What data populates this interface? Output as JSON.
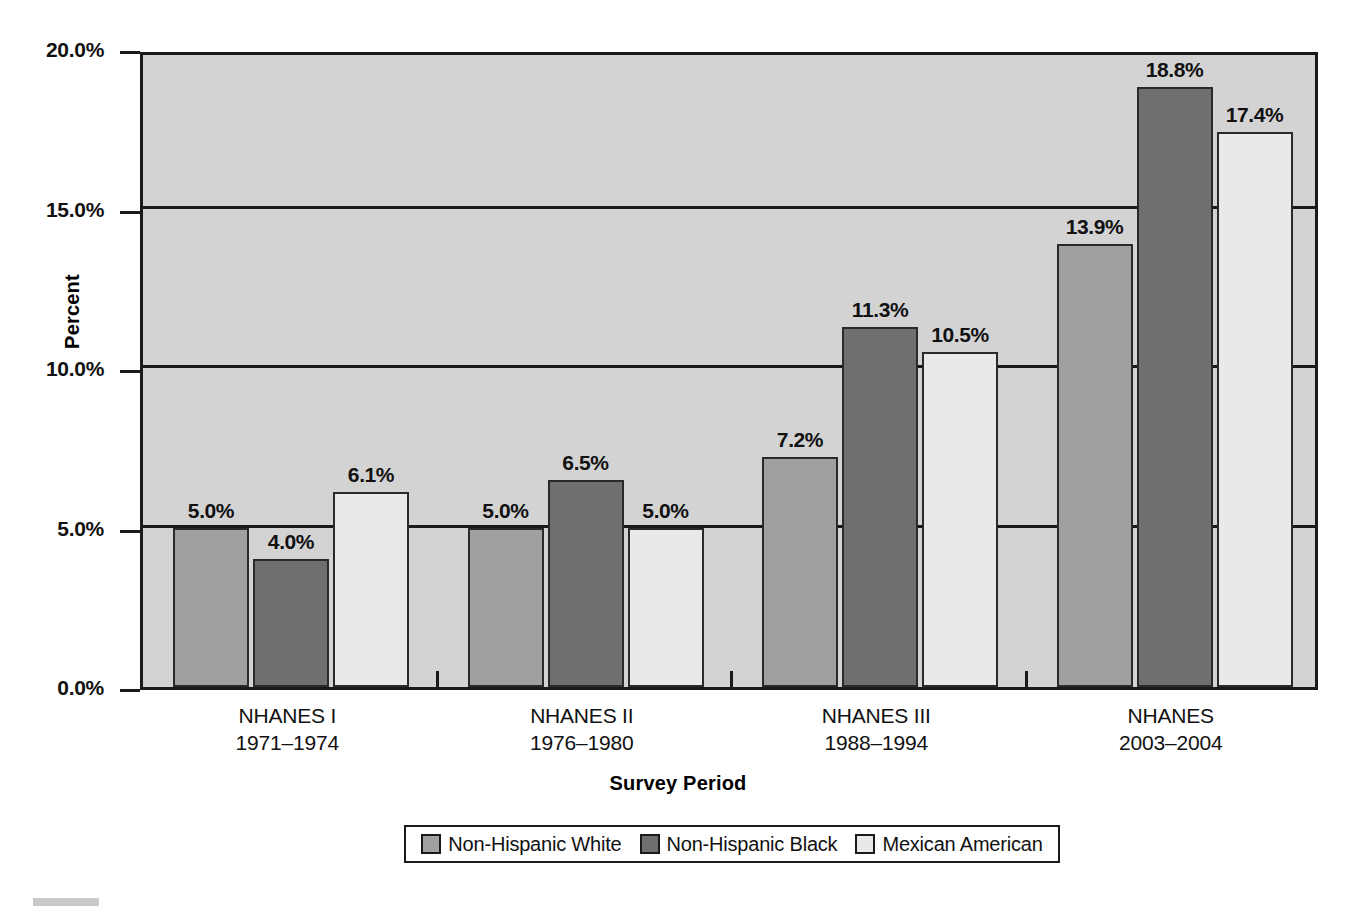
{
  "chart_data": {
    "type": "bar",
    "title": "",
    "xlabel": "Survey Period",
    "ylabel": "Percent",
    "ylim": [
      0,
      20
    ],
    "ytick_labels": [
      "0.0%",
      "5.0%",
      "10.0%",
      "15.0%",
      "20.0%"
    ],
    "ytick_values": [
      0,
      5,
      10,
      15,
      20
    ],
    "grid": true,
    "legend_position": "bottom",
    "categories": [
      "NHANES I",
      "NHANES II",
      "NHANES III",
      "NHANES"
    ],
    "category_sublabels": [
      "1971–1974",
      "1976–1980",
      "1988–1994",
      "2003–2004"
    ],
    "series": [
      {
        "name": "Non-Hispanic White",
        "color": "#a0a0a0",
        "values": [
          5.0,
          5.0,
          7.2,
          13.9
        ],
        "value_labels": [
          "5.0%",
          "5.0%",
          "7.2%",
          "13.9%"
        ]
      },
      {
        "name": "Non-Hispanic Black",
        "color": "#6f6f6f",
        "values": [
          4.0,
          6.5,
          11.3,
          18.8
        ],
        "value_labels": [
          "4.0%",
          "6.5%",
          "11.3%",
          "18.8%"
        ]
      },
      {
        "name": "Mexican American",
        "color": "#e9e9e9",
        "values": [
          6.1,
          5.0,
          10.5,
          17.4
        ],
        "value_labels": [
          "6.1%",
          "5.0%",
          "10.5%",
          "17.4%"
        ]
      }
    ]
  },
  "axes": {
    "ylabel": "Percent",
    "xlabel": "Survey Period",
    "yticks": [
      {
        "label": "20.0%",
        "value": 20
      },
      {
        "label": "15.0%",
        "value": 15
      },
      {
        "label": "10.0%",
        "value": 10
      },
      {
        "label": "5.0%",
        "value": 5
      },
      {
        "label": "0.0%",
        "value": 0
      }
    ]
  },
  "xcategories": [
    {
      "name": "NHANES I",
      "years": "1971–1974"
    },
    {
      "name": "NHANES II",
      "years": "1976–1980"
    },
    {
      "name": "NHANES III",
      "years": "1988–1994"
    },
    {
      "name": "NHANES",
      "years": "2003–2004"
    }
  ],
  "legend": {
    "entries": [
      {
        "label": "Non-Hispanic White",
        "swatch": "white-s"
      },
      {
        "label": "Non-Hispanic Black",
        "swatch": "black-s"
      },
      {
        "label": "Mexican American",
        "swatch": "mex-s"
      }
    ]
  },
  "colors": {
    "series_white": "#a0a0a0",
    "series_black": "#6f6f6f",
    "series_mexican": "#e9e9e9",
    "plot_background": "#d3d3d3",
    "axis": "#1a1a1a"
  }
}
